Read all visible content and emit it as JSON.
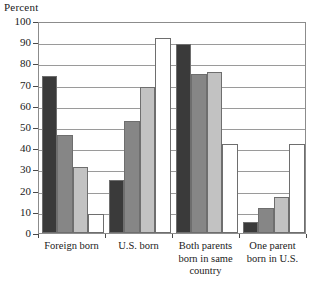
{
  "chart_data": {
    "type": "bar",
    "title": "",
    "ylabel": "Percent",
    "xlabel": "",
    "ylim": [
      0,
      100
    ],
    "ytick_step": 10,
    "yticks": [
      100,
      90,
      80,
      70,
      60,
      50,
      40,
      30,
      20,
      10,
      0
    ],
    "grid": true,
    "legend": "none",
    "categories": [
      "Foreign born",
      "U.S. born",
      "Both parents\nborn in same\ncountry",
      "One parent\nborn in U.S."
    ],
    "series": [
      {
        "name": "series-1",
        "color": "#3a3a3a",
        "values": [
          74,
          25,
          89,
          5
        ]
      },
      {
        "name": "series-2",
        "color": "#868686",
        "values": [
          46,
          53,
          75,
          12
        ]
      },
      {
        "name": "series-3",
        "color": "#c2c2c2",
        "values": [
          31,
          69,
          76,
          17
        ]
      },
      {
        "name": "series-4",
        "color": "#ffffff",
        "values": [
          9,
          92,
          42,
          42
        ]
      }
    ]
  },
  "axis": {
    "frame_color": "#8c8c8c",
    "gridline_color": "#9a9a9a",
    "tick_color": "#4a4a4a",
    "bar_border_color": "#6e6e6e"
  }
}
